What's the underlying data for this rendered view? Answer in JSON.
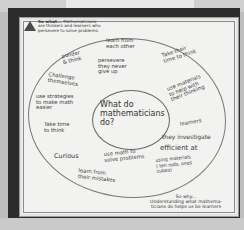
{
  "poster": {
    "header": {
      "icon": "triangle-logo-icon",
      "title": "So what...",
      "line1": "Mathematicians",
      "line2": "are thinkers and learners who",
      "line3": "persevere to solve problems."
    },
    "center_question": "What do mathematicians do?",
    "inner_notes": [
      {
        "id": "learn-from-each-other",
        "text": "learn from\neach other"
      },
      {
        "id": "persevere",
        "text": "persevere\nthey never\ngive up"
      },
      {
        "id": "ponder-think",
        "text": "ponder\n& think"
      },
      {
        "id": "challenge-themselves",
        "text": "Challenge\nthemselves"
      },
      {
        "id": "use-strategies",
        "text": "use strategies\nto make math\neasier"
      },
      {
        "id": "take-time-to-think",
        "text": "Take time\nto think"
      },
      {
        "id": "curious",
        "text": "Curious"
      },
      {
        "id": "use-math-solve",
        "text": "use math to\nsolve problems"
      },
      {
        "id": "learn-from-mistakes",
        "text": "learn from\ntheir mistakes"
      },
      {
        "id": "take-their-time",
        "text": "Take their\ntime to think"
      },
      {
        "id": "use-materials",
        "text": "use materials\nto help with\ntheir thinking"
      },
      {
        "id": "learners",
        "text": "learners"
      },
      {
        "id": "they-investigate",
        "text": "they investigate"
      },
      {
        "id": "efficient",
        "text": "efficient at"
      },
      {
        "id": "using-materials",
        "text": "using materials\n( ten rods, ones\ncubes)"
      }
    ],
    "footer": {
      "line1": "So why...",
      "line2": "Understanding what mathema-",
      "line3": "ticians do helps us be learners"
    }
  }
}
